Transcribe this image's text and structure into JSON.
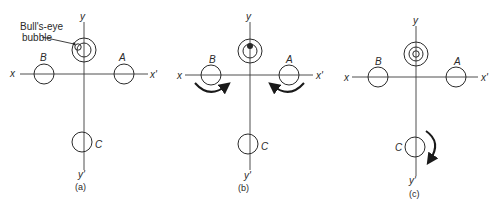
{
  "figure": {
    "annotation": "Bull's-eye bubble",
    "panels": [
      {
        "id": "a",
        "caption": "(a)",
        "axis_labels": {
          "x": "x",
          "x_prime": "x'",
          "y": "y",
          "y_prime": "y'"
        },
        "screws": {
          "A": "A",
          "B": "B",
          "C": "C"
        },
        "bubble_state": "off-center (upper-left)",
        "rotation_arrows": []
      },
      {
        "id": "b",
        "caption": "(b)",
        "axis_labels": {
          "x": "x",
          "x_prime": "x'",
          "y": "y",
          "y_prime": "y'"
        },
        "screws": {
          "A": "A",
          "B": "B",
          "C": "C"
        },
        "bubble_state": "on y-axis (top)",
        "rotation_arrows": [
          "B: clockwise-under toward center",
          "A: counter-clockwise-under toward center"
        ]
      },
      {
        "id": "c",
        "caption": "(c)",
        "axis_labels": {
          "x": "x",
          "x_prime": "x'",
          "y": "y",
          "y_prime": "y'"
        },
        "screws": {
          "A": "A",
          "B": "B",
          "C": "C"
        },
        "bubble_state": "centered",
        "rotation_arrows": [
          "C: clockwise"
        ]
      }
    ],
    "colors": {
      "line": "#2a2a2a",
      "background": "#ffffff"
    }
  }
}
